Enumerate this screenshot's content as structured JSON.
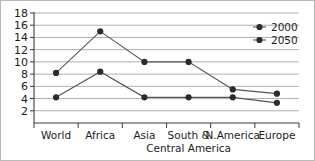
{
  "chart_data": {
    "type": "line",
    "title": "",
    "xlabel": "",
    "ylabel": "",
    "categories": [
      "World",
      "Africa",
      "Asia",
      "South &\nCentral America",
      "N.America",
      "Europe"
    ],
    "category_labels": [
      {
        "line1": "World",
        "line2": ""
      },
      {
        "line1": "Africa",
        "line2": ""
      },
      {
        "line1": "Asia",
        "line2": ""
      },
      {
        "line1": "South &",
        "line2": "Central America"
      },
      {
        "line1": "N.America",
        "line2": ""
      },
      {
        "line1": "Europe",
        "line2": ""
      }
    ],
    "series": [
      {
        "name": "2000",
        "values": [
          4.2,
          8.4,
          4.2,
          4.2,
          4.2,
          3.3
        ]
      },
      {
        "name": "2050",
        "values": [
          8.2,
          15.0,
          10.0,
          10.0,
          5.5,
          4.8
        ]
      }
    ],
    "legend": [
      "2000",
      "2050"
    ],
    "legend_position": "top-right",
    "ylim": [
      0,
      18
    ],
    "yticks": [
      2,
      4,
      6,
      8,
      10,
      12,
      14,
      16,
      18
    ],
    "grid": true,
    "colors": {
      "line": "#555555",
      "marker": "#2b2b2b",
      "gridline": "#9a9a9a",
      "axis": "#3a3a3a",
      "text": "#1b1b1b",
      "background": "#ffffff",
      "border": "#b9b9b9"
    }
  }
}
